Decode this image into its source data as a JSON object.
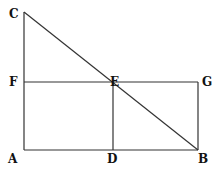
{
  "diagram": {
    "type": "geometry",
    "points": {
      "A": {
        "label": "A",
        "x": 24,
        "y": 150
      },
      "B": {
        "label": "B",
        "x": 198,
        "y": 150
      },
      "C": {
        "label": "C",
        "x": 24,
        "y": 12
      },
      "D": {
        "label": "D",
        "x": 113,
        "y": 150
      },
      "E": {
        "label": "E",
        "x": 113,
        "y": 82
      },
      "F": {
        "label": "F",
        "x": 24,
        "y": 82
      },
      "G": {
        "label": "G",
        "x": 198,
        "y": 82
      }
    },
    "segments": [
      "CA",
      "AB",
      "CB",
      "FG",
      "GB",
      "ED"
    ]
  }
}
